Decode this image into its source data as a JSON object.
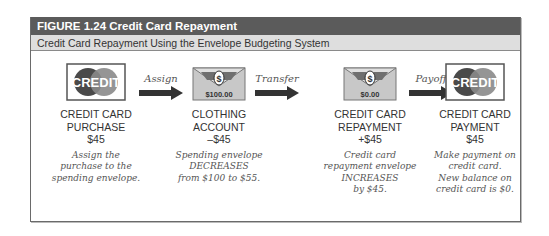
{
  "figure": {
    "label": "FIGURE 1.24  Credit Card Repayment",
    "subtitle": "Credit Card Repayment Using the Envelope Budgeting System"
  },
  "steps": [
    {
      "icon": "credit-card-icon",
      "icon_text": "CREDIT",
      "title_lines": [
        "CREDIT CARD",
        "PURCHASE",
        "$45"
      ],
      "desc_lines": [
        "Assign the",
        "purchase to the",
        "spending envelope."
      ]
    },
    {
      "icon": "envelope-icon",
      "icon_text": "$100.00",
      "title_lines": [
        "CLOTHING",
        "ACCOUNT",
        "–$45"
      ],
      "desc_lines": [
        "Spending envelope",
        "DECREASES",
        "from $100 to $55."
      ]
    },
    {
      "icon": "envelope-icon",
      "icon_text": "$0.00",
      "title_lines": [
        "CREDIT CARD",
        "REPAYMENT",
        "+$45"
      ],
      "desc_lines": [
        "Credit card",
        "repayment envelope",
        "INCREASES",
        "by $45."
      ]
    },
    {
      "icon": "credit-card-icon",
      "icon_text": "CREDIT",
      "title_lines": [
        "CREDIT CARD",
        "PAYMENT",
        "$45"
      ],
      "desc_lines": [
        "Make payment on",
        "credit card.",
        "New balance on",
        "credit card is $0."
      ]
    }
  ],
  "arrows": [
    {
      "label": "Assign"
    },
    {
      "label": "Transfer"
    },
    {
      "label": "Payoff"
    }
  ],
  "colors": {
    "header_bg": "#5b5b5b",
    "subheader_bg": "#dedede",
    "circle_dark": "#4a4a4a",
    "circle_light": "#8a8a8a",
    "envelope": "#c8c8c8"
  }
}
